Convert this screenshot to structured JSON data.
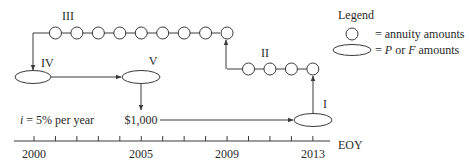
{
  "diagram": {
    "type": "cash-flow-diagram",
    "interest_text": "i = 5% per year",
    "interest": {
      "symbol": "i",
      "rest": " = 5% per year"
    },
    "amount_label": "$1,000",
    "axis": {
      "unit_label": "EOY",
      "tick_labels": [
        {
          "year": "2000",
          "index": 0
        },
        {
          "year": "2005",
          "index": 5
        },
        {
          "year": "2009",
          "index": 9
        },
        {
          "year": "2013",
          "index": 13
        }
      ],
      "tick_count": 14
    },
    "steps": {
      "I": "I",
      "II": "II",
      "III": "III",
      "IV": "IV",
      "V": "V"
    },
    "series_II_circles": 4,
    "series_III_circles": 9
  },
  "legend": {
    "title": "Legend",
    "items": [
      {
        "shape": "circle",
        "text": "= annuity amounts"
      },
      {
        "shape": "ellipse",
        "text_prefix": "= ",
        "p": "P",
        "mid": " or ",
        "f": "F",
        "suffix": " amounts"
      }
    ]
  },
  "colors": {
    "stroke": "#3a3a3a",
    "text": "#2a2a2a",
    "background": "#ffffff"
  }
}
